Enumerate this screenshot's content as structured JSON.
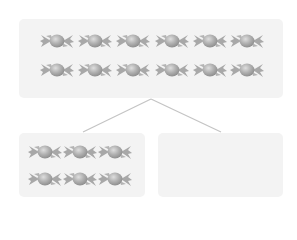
{
  "diagram": {
    "type": "part-whole split",
    "whole": {
      "rows": 2,
      "cols": 6,
      "count": 12,
      "item": "candy-icon"
    },
    "parts": [
      {
        "position": "left",
        "rows": 2,
        "cols": 3,
        "count": 6,
        "item": "candy-icon"
      },
      {
        "position": "right",
        "count": 0,
        "empty": true
      }
    ]
  },
  "colors": {
    "box_fill": "#f3f3f3",
    "candy_fill": "#a9a9a9",
    "candy_highlight": "#d2d2d2",
    "connector": "#c4c4c4"
  }
}
